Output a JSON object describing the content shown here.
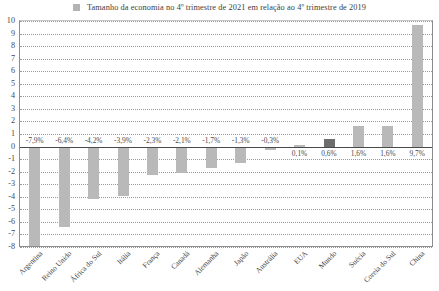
{
  "legend": {
    "marker": "legend-swatch",
    "label": "Tamanho da economia no 4º trimestre de 2021 em relação ao 4º trimestre de 2019"
  },
  "colors": {
    "bar": "#b9b9b9",
    "bar_highlight": "#6d6d6d",
    "axis": "#8c8c8c",
    "zero_line": "#4a4a4a",
    "gridline": "#9a9a9a",
    "text": "#3f3f3f"
  },
  "chart_data": {
    "type": "bar",
    "title": "",
    "subtitle": "",
    "xlabel": "",
    "ylabel": "",
    "legend_position": "top",
    "grid": true,
    "ylim": [
      -8,
      10
    ],
    "yticks": [
      10,
      9,
      8,
      7,
      6,
      5,
      4,
      3,
      2,
      1,
      0,
      -1,
      -2,
      -3,
      -4,
      -5,
      -6,
      -7,
      -8
    ],
    "ytick_labels": [
      "10",
      "9",
      "8",
      "7",
      "6",
      "5",
      "4",
      "3",
      "2",
      "1",
      "0",
      "-1",
      "-2",
      "-3",
      "-4",
      "-5",
      "-6",
      "-7",
      "-8"
    ],
    "categories": [
      "Argentina",
      "Reino Unido",
      "África do Sul",
      "Itália",
      "França",
      "Canadá",
      "Alemanha",
      "Japão",
      "Austrália",
      "EUA",
      "Mundo",
      "Suécia",
      "Coreia do Sul",
      "China"
    ],
    "values": [
      -7.9,
      -6.4,
      -4.2,
      -3.9,
      -2.3,
      -2.1,
      -1.7,
      -1.3,
      -0.3,
      0.1,
      0.6,
      1.6,
      1.6,
      9.7
    ],
    "data_labels": [
      "-7,9%",
      "-6,4%",
      "-4,2%",
      "-3,9%",
      "-2,3%",
      "-2,1%",
      "-1,7%",
      "-1,3%",
      "-0,3%",
      "0,1%",
      "0,6%",
      "1,6%",
      "1,6%",
      "9,7%"
    ],
    "highlight_index": 10,
    "series": [
      {
        "name": "Tamanho da economia no 4º trimestre de 2021 em relação ao 4º trimestre de 2019",
        "values": [
          -7.9,
          -6.4,
          -4.2,
          -3.9,
          -2.3,
          -2.1,
          -1.7,
          -1.3,
          -0.3,
          0.1,
          0.6,
          1.6,
          1.6,
          9.7
        ]
      }
    ]
  }
}
